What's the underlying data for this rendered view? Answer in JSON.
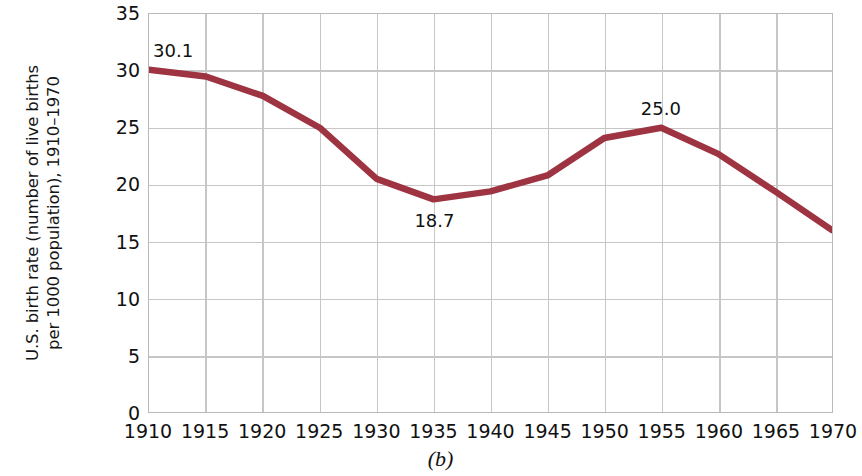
{
  "chart_data": {
    "type": "line",
    "title": "",
    "subtitle": "",
    "xlabel": "",
    "ylabel": "U.S. birth rate (number of live births per 1000 population), 1910–1970",
    "ylabel_lines": [
      "U.S. birth rate (number of live births",
      "per 1000 population),",
      "1910–1970"
    ],
    "caption": "(b)",
    "x": [
      1910,
      1915,
      1920,
      1925,
      1930,
      1935,
      1940,
      1945,
      1950,
      1955,
      1960,
      1965,
      1970
    ],
    "values": [
      30.1,
      29.5,
      27.8,
      25.0,
      20.5,
      18.7,
      19.4,
      20.8,
      24.1,
      25.0,
      22.7,
      19.4,
      16.0
    ],
    "series": [
      {
        "name": "U.S. birth rate",
        "values": [
          30.1,
          29.5,
          27.8,
          25.0,
          20.5,
          18.7,
          19.4,
          20.8,
          24.1,
          25.0,
          22.7,
          19.4,
          16.0
        ]
      }
    ],
    "xtick_labels": [
      "1910",
      "1915",
      "1920",
      "1925",
      "1930",
      "1935",
      "1940",
      "1945",
      "1950",
      "1955",
      "1960",
      "1965",
      "1970"
    ],
    "ytick_labels": [
      "0",
      "5",
      "10",
      "15",
      "20",
      "25",
      "30",
      "35"
    ],
    "yticks": [
      0,
      5,
      10,
      15,
      20,
      25,
      30,
      35
    ],
    "xlim": [
      1910,
      1970
    ],
    "ylim": [
      0,
      35
    ],
    "grid": true,
    "legend": false,
    "legend_position": "none",
    "line_color": "#9e3442",
    "grid_color": "#c6c6c6",
    "background_color": "#ffffff",
    "annotations": [
      {
        "label": "30.1",
        "x": 1910,
        "y": 30.1
      },
      {
        "label": "18.7",
        "x": 1935,
        "y": 18.7
      },
      {
        "label": "25.0",
        "x": 1955,
        "y": 25.0
      }
    ]
  }
}
